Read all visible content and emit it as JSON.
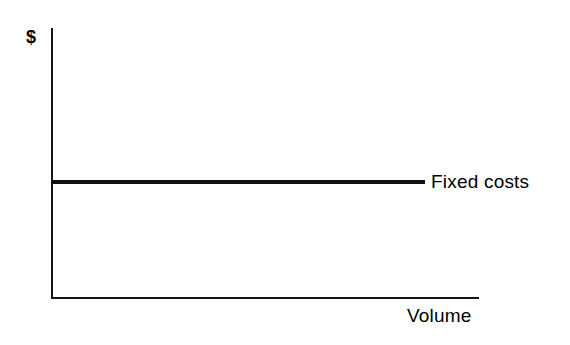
{
  "chart_data": {
    "type": "line",
    "title": "",
    "subtitle": "",
    "xlabel": "Volume",
    "ylabel": "$",
    "xlim": [
      0,
      100
    ],
    "ylim": [
      0,
      100
    ],
    "grid": false,
    "x_tick_labels": [],
    "y_tick_labels": [],
    "legend_position": "inline-right",
    "annotations": [
      {
        "text": "Fixed costs",
        "x": 88,
        "y": 43
      }
    ],
    "series": [
      {
        "name": "Fixed costs",
        "label": "Fixed costs",
        "color": "#101010",
        "line_width": 4,
        "x": [
          0,
          100
        ],
        "values": [
          43,
          43
        ]
      }
    ]
  },
  "axes": {
    "y_axis_label": "$",
    "x_axis_label": "Volume",
    "axis_color": "#151515"
  },
  "series_labels": {
    "fixed_costs": "Fixed costs"
  }
}
